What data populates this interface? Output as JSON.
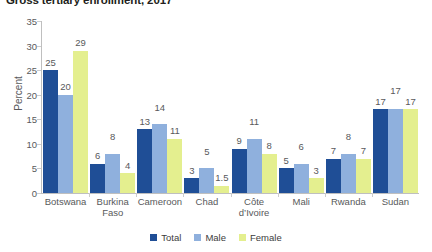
{
  "chart_data": {
    "type": "bar",
    "title": "Gross tertiary enrollment, 2017",
    "xlabel": "",
    "ylabel": "Percent",
    "ylim": [
      0,
      35
    ],
    "ytick_step": 5,
    "yticks": [
      35,
      30,
      25,
      20,
      15,
      10,
      5,
      0
    ],
    "ytick_labels": [
      "35",
      "30",
      "25",
      "20",
      "15",
      "10",
      "5",
      "0"
    ],
    "grid": false,
    "legend_position": "bottom",
    "categories": [
      "Botswana",
      "Burkina Faso",
      "Cameroon",
      "Chad",
      "Côte d’Ivoire",
      "Mali",
      "Rwanda",
      "Sudan"
    ],
    "category_lines": [
      [
        "Botswana"
      ],
      [
        "Burkina",
        "Faso"
      ],
      [
        "Cameroon"
      ],
      [
        "Chad"
      ],
      [
        "Côte",
        "d’Ivoire"
      ],
      [
        "Mali"
      ],
      [
        "Rwanda"
      ],
      [
        "Sudan"
      ]
    ],
    "series": [
      {
        "name": "Total",
        "color": "#1f4e96",
        "values": [
          25,
          6,
          13,
          3,
          9,
          5,
          7,
          17
        ],
        "labels": [
          "25",
          "6",
          "13",
          "3",
          "9",
          "5",
          "7",
          "17"
        ]
      },
      {
        "name": "Male",
        "color": "#8fb0dd",
        "values": [
          20,
          8,
          14,
          5,
          11,
          6,
          8,
          17
        ],
        "labels": [
          "20",
          "8",
          "14",
          "5",
          "11",
          "6",
          "8",
          "17"
        ]
      },
      {
        "name": "Female",
        "color": "#e4ef8f",
        "values": [
          29,
          4,
          11,
          1.5,
          8,
          3,
          7,
          17
        ],
        "labels": [
          "29",
          "4",
          "11",
          "1.5",
          "8",
          "3",
          "7",
          "17"
        ]
      }
    ],
    "label_offsets": {
      "comment": "extra vertical lift (px) applied to individual value labels so they do not collide",
      "Sudan_Male": 12
    }
  },
  "legend": {
    "items": [
      {
        "label": "Total",
        "color": "#1f4e96"
      },
      {
        "label": "Male",
        "color": "#8fb0dd"
      },
      {
        "label": "Female",
        "color": "#e4ef8f"
      }
    ]
  }
}
